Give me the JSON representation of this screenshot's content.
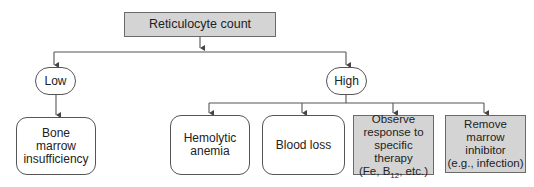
{
  "diagram": {
    "type": "flowchart",
    "root": {
      "label": "Reticulocyte count",
      "style": "grey-rect"
    },
    "branches": [
      {
        "label": "Low",
        "style": "oval",
        "children": [
          {
            "label": "Bone\nmarrow\ninsufficiency",
            "style": "rounded-rect"
          }
        ]
      },
      {
        "label": "High",
        "style": "oval",
        "children": [
          {
            "label": "Hemolytic\nanemia",
            "style": "rounded-rect"
          },
          {
            "label": "Blood loss",
            "style": "rounded-rect"
          },
          {
            "label_lines": [
              "Observe",
              "response to",
              "specific therapy"
            ],
            "label_last_prefix": "(Fe, B",
            "label_last_sub": "12",
            "label_last_suffix": ", etc.)",
            "label": "Observe response to specific therapy (Fe, B12, etc.)",
            "style": "grey-rect"
          },
          {
            "label": "Remove\nmarrow\ninhibitor\n(e.g., infection)",
            "style": "grey-rect"
          }
        ]
      }
    ],
    "colors": {
      "grey_fill": "#d4d4d4",
      "border": "#555555",
      "line": "#555555"
    }
  }
}
